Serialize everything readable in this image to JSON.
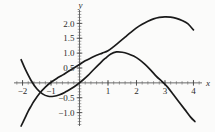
{
  "figure": {
    "background_color": "#fbfbfa",
    "axis_color": "#555555",
    "curve_color": "#1a1a1a"
  },
  "axes": {
    "x_name": "x",
    "y_name": "y",
    "x_tick_labels": [
      "−2",
      "−1",
      "1",
      "2",
      "3",
      "4"
    ],
    "x_tick_values": [
      -2,
      -1,
      1,
      2,
      3,
      4
    ],
    "y_tick_labels": [
      "2.0",
      "1.5",
      "1.0",
      "0.5",
      "−0.5",
      "−1.0"
    ],
    "y_tick_values": [
      2.0,
      1.5,
      1.0,
      0.5,
      -0.5,
      -1.0
    ]
  },
  "chart_data": {
    "type": "line",
    "title": "",
    "xlabel": "x",
    "ylabel": "y",
    "xlim": [
      -2.3,
      4.3
    ],
    "ylim": [
      -1.45,
      2.45
    ],
    "grid": false,
    "legend": "none",
    "x_ticks": [
      -2,
      -1,
      1,
      2,
      3,
      4
    ],
    "y_ticks": [
      2.0,
      1.5,
      1.0,
      0.5,
      -0.5,
      -1.0
    ],
    "x_minor_tick_step": 0.2,
    "y_minor_tick_step": 0.1,
    "annotations": [],
    "series": [
      {
        "name": "curve-1",
        "description": "steep rising S-shaped cubic-like curve peaking near x=3",
        "x": [
          -2.05,
          -1.9,
          -1.8,
          -1.7,
          -1.6,
          -1.4,
          -1.2,
          -1.0,
          -0.8,
          -0.6,
          -0.4,
          -0.2,
          0.0,
          0.2,
          0.4,
          0.6,
          0.8,
          1.0,
          1.2,
          1.4,
          1.6,
          1.8,
          2.0,
          2.2,
          2.4,
          2.6,
          2.8,
          3.0,
          3.2,
          3.4,
          3.6,
          3.8,
          4.0
        ],
        "y": [
          -1.45,
          -1.15,
          -0.95,
          -0.78,
          -0.62,
          -0.35,
          -0.14,
          0.02,
          0.15,
          0.26,
          0.38,
          0.5,
          0.62,
          0.74,
          0.84,
          0.93,
          1.0,
          1.08,
          1.22,
          1.38,
          1.54,
          1.7,
          1.85,
          1.97,
          2.07,
          2.15,
          2.2,
          2.22,
          2.21,
          2.17,
          2.1,
          1.99,
          1.78
        ]
      },
      {
        "name": "curve-2",
        "description": "downward-opening curve with local minimum near x=-1 and maximum near x=1.2, zero near x=3",
        "x": [
          -2.05,
          -1.9,
          -1.7,
          -1.5,
          -1.3,
          -1.1,
          -0.9,
          -0.7,
          -0.5,
          -0.3,
          -0.1,
          0.1,
          0.3,
          0.5,
          0.7,
          0.9,
          1.1,
          1.3,
          1.5,
          1.7,
          1.9,
          2.1,
          2.3,
          2.5,
          2.7,
          2.9,
          3.1,
          3.3,
          3.5,
          3.7,
          3.9,
          4.05
        ],
        "y": [
          0.78,
          0.45,
          0.08,
          -0.2,
          -0.37,
          -0.45,
          -0.45,
          -0.4,
          -0.31,
          -0.2,
          -0.07,
          0.08,
          0.25,
          0.45,
          0.64,
          0.82,
          0.97,
          1.04,
          1.03,
          0.98,
          0.9,
          0.78,
          0.62,
          0.43,
          0.22,
          0.04,
          -0.15,
          -0.4,
          -0.65,
          -0.9,
          -1.15,
          -1.3
        ]
      }
    ]
  }
}
